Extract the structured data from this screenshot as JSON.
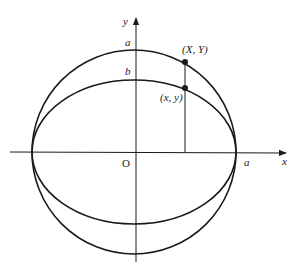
{
  "diagram": {
    "type": "circle-ellipse-construction",
    "labels": {
      "y_axis": "y",
      "x_axis": "x",
      "origin": "O",
      "a_top": "a",
      "b_top": "b",
      "a_right": "a",
      "point_circle": "(X, Y)",
      "point_ellipse": "(x, y)"
    },
    "geometry": {
      "center": [
        136,
        152
      ],
      "circle_radius": 102,
      "ellipse_rx": 102,
      "ellipse_ry": 72,
      "vertical_line_x": 185
    },
    "colors": {
      "stroke": "#1a1a1a"
    }
  }
}
